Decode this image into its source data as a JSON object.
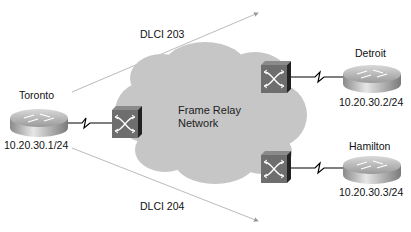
{
  "diagram": {
    "title_cutoff": "... ...... ...... .... ....... .",
    "cloud": {
      "label_line1": "Frame Relay",
      "label_line2": "Network",
      "fill": "#c8c8c8"
    },
    "pvcs": [
      {
        "label": "DLCI 203",
        "from": "Toronto",
        "to": "Detroit"
      },
      {
        "label": "DLCI 204",
        "from": "Toronto",
        "to": "Hamilton"
      }
    ],
    "routers": [
      {
        "name": "Toronto",
        "ip": "10.20.30.1/24"
      },
      {
        "name": "Detroit",
        "ip": "10.20.30.2/24"
      },
      {
        "name": "Hamilton",
        "ip": "10.20.30.3/24"
      }
    ],
    "switches": [
      "Frame Relay switch (Toronto side)",
      "Frame Relay switch (Detroit side)",
      "Frame Relay switch (Hamilton side)"
    ],
    "colors": {
      "switch_face": "#6e6e6e",
      "switch_side": "#2a2a2a",
      "router_body": "#a8a8a8",
      "line": "#000000",
      "pvc_line": "#a0a0a0"
    }
  }
}
